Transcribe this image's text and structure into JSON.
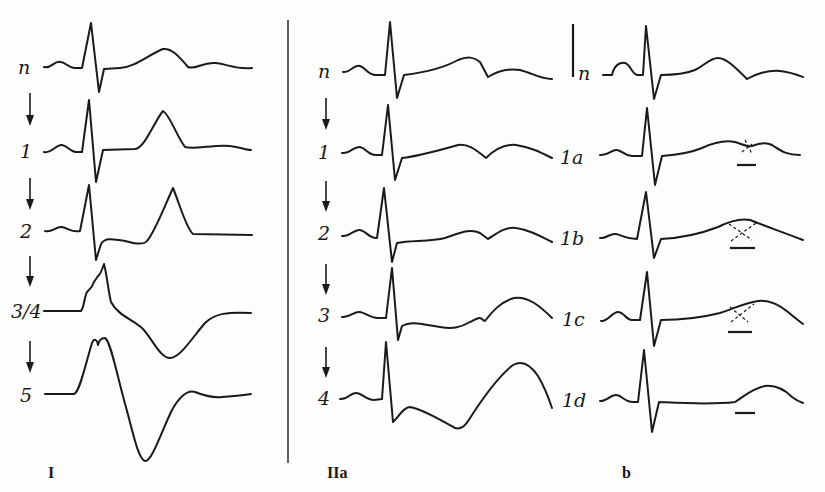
{
  "figure": {
    "panels": [
      {
        "id": "I",
        "label": "I",
        "traces": [
          {
            "label": "n"
          },
          {
            "label": "1"
          },
          {
            "label": "2"
          },
          {
            "label": "3/4"
          },
          {
            "label": "5"
          }
        ]
      },
      {
        "id": "IIa",
        "label": "IIa",
        "traces": [
          {
            "label": "n"
          },
          {
            "label": "1"
          },
          {
            "label": "2"
          },
          {
            "label": "3"
          },
          {
            "label": "4"
          }
        ]
      },
      {
        "id": "b",
        "label": "b",
        "traces": [
          {
            "label": "n"
          },
          {
            "label": "1a"
          },
          {
            "label": "1b"
          },
          {
            "label": "1c"
          },
          {
            "label": "1d"
          }
        ]
      }
    ],
    "colors": {
      "ink": "#1a1a1a",
      "paper": "#fdfdfb"
    }
  }
}
